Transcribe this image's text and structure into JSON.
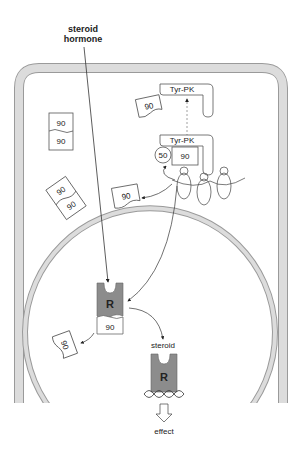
{
  "labels": {
    "steroid_hormone_line1": "steroid",
    "steroid_hormone_line2": "hormone",
    "tyr_pk_top": "Tyr-PK",
    "tyr_pk_complex": "Tyr-PK",
    "hsp50": "50",
    "hsp90_complex": "90",
    "hsp90_free_top": "90",
    "hsp90_stack_top": "90",
    "hsp90_stack_bottom": "90",
    "hsp90_tilted_top": "90",
    "hsp90_tilted_bottom": "90",
    "hsp90_released": "90",
    "receptor_R_bound": "R",
    "receptor_hsp90": "90",
    "hsp90_nucleus_released": "90",
    "steroid_small": "steroid",
    "receptor_R_active": "R",
    "effect": "effect"
  },
  "colors": {
    "membrane": "#d6d6d6",
    "membrane_edge": "#9a9a9a",
    "receptor": "#8c8c8c",
    "line": "#333333"
  }
}
